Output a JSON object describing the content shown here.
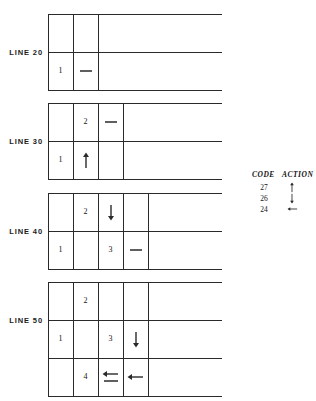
{
  "figure": {
    "title": "",
    "background_color": "#ffffff",
    "line_color": "#2a2a2a",
    "text_color": "#141414"
  },
  "blocks": [
    {
      "label": "LINE 20",
      "columns": 2,
      "rows": 2,
      "cells": [
        {
          "row": 0,
          "col": 0,
          "text": "",
          "symbol": ""
        },
        {
          "row": 0,
          "col": 1,
          "text": "",
          "symbol": ""
        },
        {
          "row": 1,
          "col": 0,
          "text": "1",
          "symbol": ""
        },
        {
          "row": 1,
          "col": 1,
          "text": "",
          "symbol": "dash"
        }
      ]
    },
    {
      "label": "LINE 30",
      "columns": 3,
      "rows": 2,
      "cells": [
        {
          "row": 0,
          "col": 0,
          "text": "",
          "symbol": ""
        },
        {
          "row": 0,
          "col": 1,
          "text": "2",
          "symbol": ""
        },
        {
          "row": 0,
          "col": 2,
          "text": "",
          "symbol": "dash"
        },
        {
          "row": 1,
          "col": 0,
          "text": "1",
          "symbol": ""
        },
        {
          "row": 1,
          "col": 1,
          "text": "",
          "symbol": "arrow-up"
        },
        {
          "row": 1,
          "col": 2,
          "text": "",
          "symbol": ""
        }
      ]
    },
    {
      "label": "LINE 40",
      "columns": 4,
      "rows": 2,
      "cells": [
        {
          "row": 0,
          "col": 0,
          "text": "",
          "symbol": ""
        },
        {
          "row": 0,
          "col": 1,
          "text": "2",
          "symbol": ""
        },
        {
          "row": 0,
          "col": 2,
          "text": "",
          "symbol": "arrow-down"
        },
        {
          "row": 0,
          "col": 3,
          "text": "",
          "symbol": ""
        },
        {
          "row": 1,
          "col": 0,
          "text": "1",
          "symbol": ""
        },
        {
          "row": 1,
          "col": 1,
          "text": "",
          "symbol": ""
        },
        {
          "row": 1,
          "col": 2,
          "text": "3",
          "symbol": ""
        },
        {
          "row": 1,
          "col": 3,
          "text": "",
          "symbol": "dash"
        }
      ]
    },
    {
      "label": "LINE 50",
      "columns": 4,
      "rows": 3,
      "cells": [
        {
          "row": 0,
          "col": 0,
          "text": "",
          "symbol": ""
        },
        {
          "row": 0,
          "col": 1,
          "text": "2",
          "symbol": ""
        },
        {
          "row": 0,
          "col": 2,
          "text": "",
          "symbol": ""
        },
        {
          "row": 0,
          "col": 3,
          "text": "",
          "symbol": ""
        },
        {
          "row": 1,
          "col": 0,
          "text": "1",
          "symbol": ""
        },
        {
          "row": 1,
          "col": 1,
          "text": "",
          "symbol": ""
        },
        {
          "row": 1,
          "col": 2,
          "text": "3",
          "symbol": ""
        },
        {
          "row": 1,
          "col": 3,
          "text": "",
          "symbol": "arrow-down"
        },
        {
          "row": 2,
          "col": 0,
          "text": "",
          "symbol": ""
        },
        {
          "row": 2,
          "col": 1,
          "text": "4",
          "symbol": ""
        },
        {
          "row": 2,
          "col": 2,
          "text": "",
          "symbol": "arrow-left-underline"
        },
        {
          "row": 2,
          "col": 3,
          "text": "",
          "symbol": "arrow-left"
        }
      ]
    }
  ],
  "legend": {
    "header_code": "CODE",
    "header_action": "ACTION",
    "rows": [
      {
        "code": "27",
        "action": "arrow-up"
      },
      {
        "code": "26",
        "action": "arrow-down"
      },
      {
        "code": "24",
        "action": "arrow-left"
      }
    ]
  }
}
